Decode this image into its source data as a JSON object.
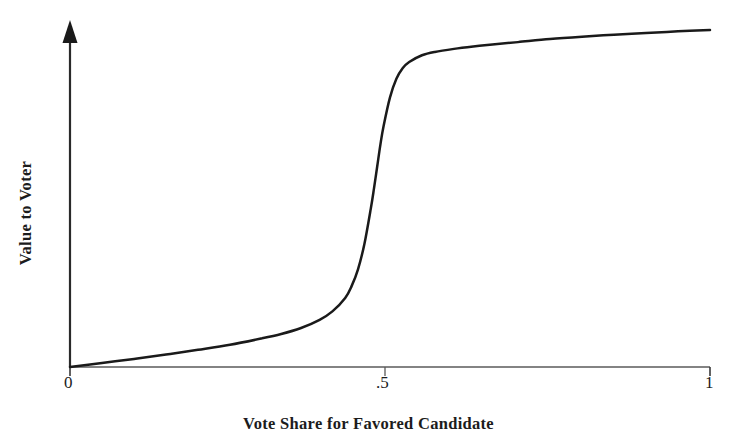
{
  "figure": {
    "background_color": "#ffffff",
    "curve_color": "#1a1a1a",
    "axis_color": "#5a5a5a",
    "text_color": "#1c1c1c"
  },
  "axes": {
    "x_title": "Vote Share for Favored Candidate",
    "y_title": "Value to Voter",
    "x_tick_labels": [
      "0",
      ".5",
      "1"
    ],
    "y_tick_labels": []
  },
  "chart_data": {
    "type": "line",
    "title": "",
    "subtitle": "",
    "xlabel": "Vote Share for Favored Candidate",
    "ylabel": "Value to Voter",
    "xlim": [
      0,
      1
    ],
    "ylim": [
      0,
      1
    ],
    "xticks": [
      0,
      0.5,
      1
    ],
    "xticklabels": [
      "0",
      ".5",
      "1"
    ],
    "yticks": [],
    "yticklabels": [],
    "grid": false,
    "legend": null,
    "annotations": [],
    "series": [
      {
        "name": "Value to Voter",
        "description": "Steep S-shaped (sigmoid) curve: value rises very slowly for vote shares below about 0.4, jumps sharply just below 0.5, then flattens toward a high plateau.",
        "inflection_x": 0.48,
        "color": "#1a1a1a",
        "line_width": 2.5,
        "x": [
          0.0,
          0.05,
          0.1,
          0.15,
          0.2,
          0.25,
          0.3,
          0.33,
          0.36,
          0.39,
          0.41,
          0.43,
          0.44,
          0.45,
          0.46,
          0.47,
          0.475,
          0.48,
          0.485,
          0.49,
          0.5,
          0.51,
          0.52,
          0.53,
          0.55,
          0.57,
          0.6,
          0.63,
          0.66,
          0.7,
          0.75,
          0.8,
          0.85,
          0.9,
          0.95,
          1.0
        ],
        "y": [
          0.0,
          0.012,
          0.024,
          0.037,
          0.051,
          0.066,
          0.085,
          0.098,
          0.115,
          0.14,
          0.165,
          0.205,
          0.24,
          0.29,
          0.365,
          0.47,
          0.53,
          0.595,
          0.66,
          0.715,
          0.8,
          0.855,
          0.887,
          0.905,
          0.925,
          0.935,
          0.944,
          0.951,
          0.957,
          0.964,
          0.973,
          0.98,
          0.986,
          0.991,
          0.996,
          1.0
        ]
      }
    ]
  },
  "geometry": {
    "origin_x": 70,
    "origin_y": 367,
    "x_axis_right": 710,
    "y_axis_top": 30,
    "tick_x_positions": [
      70,
      385,
      710
    ],
    "tick_length": 9
  }
}
